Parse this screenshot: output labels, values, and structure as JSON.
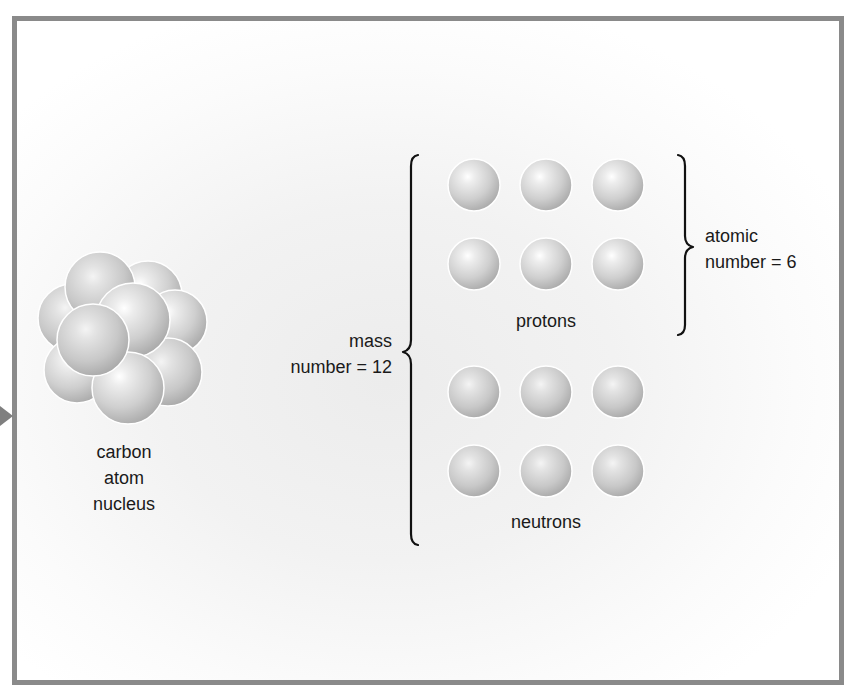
{
  "diagram": {
    "nucleus": {
      "label_lines": [
        "carbon",
        "atom",
        "nucleus"
      ],
      "sphere_count": 9
    },
    "protons": {
      "label": "protons",
      "count": 6,
      "grid": {
        "rows": 2,
        "cols": 3
      }
    },
    "neutrons": {
      "label": "neutrons",
      "count": 6,
      "grid": {
        "rows": 2,
        "cols": 3
      }
    },
    "atomic_number": {
      "lines": [
        "atomic",
        "number = 6"
      ],
      "value": 6
    },
    "mass_number": {
      "lines": [
        "mass",
        "number = 12"
      ],
      "value": 12
    },
    "colors": {
      "frame_border": "#8a8a8a",
      "arrow": "#7f7f7f",
      "sphere_highlight": "#ffffff",
      "sphere_mid": "#d6d6d6",
      "sphere_shadow": "#a9a9a9",
      "brace": "#111111",
      "text": "#1a1a1a"
    }
  }
}
